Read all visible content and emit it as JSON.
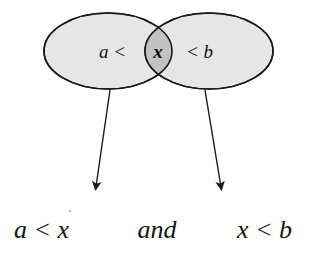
{
  "diagram": {
    "colors": {
      "background": "#ffffff",
      "ellipse_fill": "#e6e6e6",
      "intersection_fill": "#c2c2c2",
      "stroke": "#1a1a1a",
      "text": "#141414"
    },
    "left_set": {
      "label": "a <",
      "name": "left-ellipse"
    },
    "right_set": {
      "label": "< b",
      "name": "right-ellipse"
    },
    "intersection": {
      "label": "x",
      "name": "intersection-region"
    },
    "arrows": [
      {
        "name": "left-arrow",
        "from_x": 110,
        "from_y": 90,
        "to_x": 94,
        "to_y": 198
      },
      {
        "name": "right-arrow",
        "from_x": 205,
        "from_y": 90,
        "to_x": 223,
        "to_y": 198
      }
    ],
    "conclusion": {
      "left_expression": "a < x",
      "conjunction": "and",
      "right_expression": "x < b"
    }
  }
}
